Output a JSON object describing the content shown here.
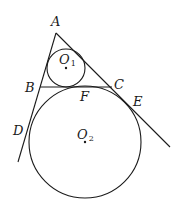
{
  "diagram": {
    "type": "geometry",
    "points": {
      "A": {
        "label": "A",
        "x": 56,
        "y": 33
      },
      "B": {
        "label": "B",
        "x": 40,
        "y": 87
      },
      "C": {
        "label": "C",
        "x": 112,
        "y": 87
      },
      "D": {
        "label": "D",
        "x": 28,
        "y": 128
      },
      "E": {
        "label": "E",
        "x": 132,
        "y": 112
      },
      "F": {
        "label": "F",
        "x": 85,
        "y": 87
      }
    },
    "circles": [
      {
        "name": "O1",
        "label": "O",
        "subscript": "1",
        "cx": 66,
        "cy": 68,
        "r": 19
      },
      {
        "name": "O2",
        "label": "O",
        "subscript": "2",
        "cx": 85,
        "cy": 142,
        "r": 56
      }
    ],
    "lines": [
      {
        "name": "line-AD",
        "from": "A",
        "through": "B",
        "to": [
          18,
          162
        ]
      },
      {
        "name": "line-AE",
        "from": "A",
        "through": "C",
        "to": [
          170,
          147
        ]
      },
      {
        "name": "segment-BC",
        "from": "B",
        "to": "C"
      }
    ],
    "labels": {
      "A": "A",
      "B": "B",
      "C": "C",
      "D": "D",
      "E": "E",
      "F": "F",
      "O1_main": "O",
      "O1_sub": "1",
      "O2_main": "O",
      "O2_sub": "2"
    }
  }
}
